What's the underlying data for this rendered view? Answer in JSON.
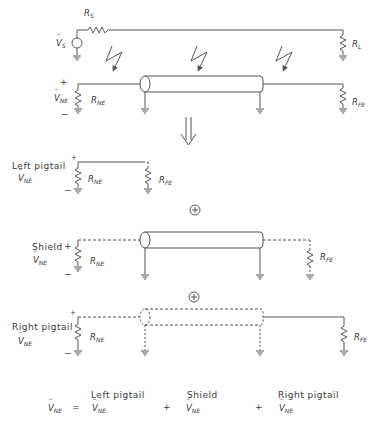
{
  "diagram": {
    "top_circuit": {
      "source_label": "V_S",
      "source_resistor": "R_S",
      "load_resistor": "R_L",
      "near_end_voltage": "V_NE",
      "near_end_resistor": "R_NE",
      "far_end_resistor": "R_FE",
      "plus_sign": "+",
      "minus_sign": "−",
      "coupling_arrows": 3
    },
    "equivalence_arrow": "⇓",
    "sections": [
      {
        "name": "left-pigtail",
        "label": "Left pigtail",
        "voltage": "V_NE",
        "near_resistor": "R_NE",
        "far_resistor": "R_FE",
        "plus": "+",
        "minus": "−"
      },
      {
        "name": "shield",
        "label": "Shield",
        "voltage": "V_NE",
        "near_resistor": "R_NE",
        "far_resistor": "R_FE",
        "plus": "+",
        "minus": "−"
      },
      {
        "name": "right-pigtail",
        "label": "Right pigtail",
        "voltage": "V_NE",
        "near_resistor": "R_NE",
        "far_resistor": "R_FE",
        "plus": "+",
        "minus": "−"
      }
    ],
    "superposition_symbol": "⊕",
    "equation": {
      "lhs": "V_NE",
      "equals": "=",
      "plus": "+",
      "terms": [
        {
          "label": "Left pigtail",
          "symbol": "V_NE"
        },
        {
          "label": "Shield",
          "symbol": "V_NE"
        },
        {
          "label": "Right pigtail",
          "symbol": "V_NE"
        }
      ]
    }
  }
}
